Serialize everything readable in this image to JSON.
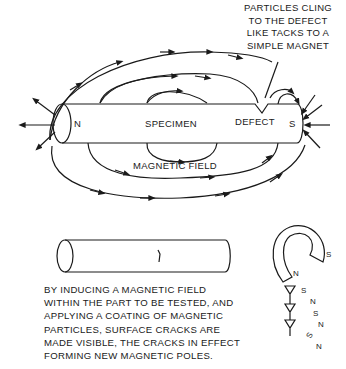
{
  "diagram": {
    "callout": {
      "lines": [
        "PARTICLES CLING",
        "TO THE DEFECT",
        "LIKE TACKS TO A",
        "SIMPLE MAGNET"
      ]
    },
    "bar_magnet": {
      "north_label": "N",
      "south_label": "S",
      "specimen_label": "SPECIMEN",
      "defect_label": "DEFECT",
      "field_label": "MAGNETIC FIELD"
    },
    "horseshoe": {
      "pole_s": "S",
      "pole_n": "N",
      "tack_poles": [
        "S",
        "N",
        "S",
        "N",
        "S",
        "N"
      ]
    },
    "caption": {
      "lines": [
        "BY INDUCING A MAGNETIC FIELD",
        "WITHIN THE PART TO BE TESTED, AND",
        "APPLYING A COATING OF MAGNETIC",
        "PARTICLES, SURFACE CRACKS ARE",
        "MADE VISIBLE, THE CRACKS IN EFFECT",
        "FORMING NEW MAGNETIC POLES."
      ]
    },
    "colors": {
      "ink": "#1a1a1a",
      "background": "#ffffff"
    }
  }
}
